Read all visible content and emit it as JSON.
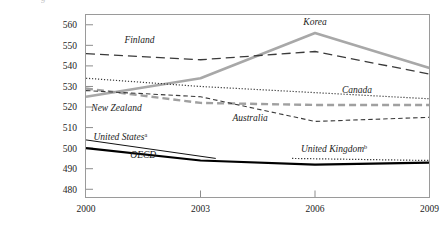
{
  "chart_data": {
    "type": "line",
    "title": "",
    "xlabel": "",
    "ylabel": "",
    "x": [
      2000,
      2003,
      2006,
      2009
    ],
    "xlim": [
      2000,
      2009
    ],
    "ylim": [
      476,
      565
    ],
    "yticks": [
      480,
      490,
      500,
      510,
      520,
      530,
      540,
      550,
      560
    ],
    "xticks": [
      2000,
      2003,
      2006,
      2009
    ],
    "grid": false,
    "legend": "inline-labels",
    "series": [
      {
        "name": "Korea",
        "values": [
          525,
          534,
          556,
          539
        ],
        "style": "thick-gray-solid",
        "color": "#a8a8a8"
      },
      {
        "name": "Finland",
        "values": [
          546,
          543,
          547,
          536
        ],
        "style": "long-dash",
        "color": "#3a3a3a"
      },
      {
        "name": "Canada",
        "values": [
          534,
          530,
          527,
          524
        ],
        "style": "dotted",
        "color": "#3a3a3a"
      },
      {
        "name": "New Zealand",
        "values": [
          529,
          522,
          521,
          521
        ],
        "style": "gray-dash",
        "color": "#a0a0a0"
      },
      {
        "name": "Australia",
        "values": [
          528,
          525,
          513,
          515
        ],
        "style": "fine-dash",
        "color": "#3a3a3a"
      },
      {
        "name": "United States",
        "values": [
          504,
          495,
          0,
          0
        ],
        "style": "thin-black",
        "color": "#111111",
        "note_marker": "a",
        "partial": true
      },
      {
        "name": "OECD",
        "values": [
          500,
          494,
          492,
          493
        ],
        "style": "thick-black",
        "color": "#000000"
      },
      {
        "name": "United Kingdom",
        "values": [
          0,
          0,
          495,
          494
        ],
        "style": "dotted",
        "color": "#2b2b2b",
        "note_marker": "b",
        "partial": true
      }
    ],
    "annotations": [
      {
        "text": "Finland",
        "x": 2001.4,
        "y": 551
      },
      {
        "text": "Korea",
        "x": 2006.0,
        "y": 560
      },
      {
        "text": "Canada",
        "x": 2007.1,
        "y": 527
      },
      {
        "text": "New Zealand",
        "x": 2000.8,
        "y": 518
      },
      {
        "text": "Australia",
        "x": 2004.3,
        "y": 513
      },
      {
        "text": "United States",
        "x": 2000.9,
        "y": 504,
        "marker": "a"
      },
      {
        "text": "OECD",
        "x": 2001.5,
        "y": 495
      },
      {
        "text": "United Kingdom",
        "x": 2006.5,
        "y": 498,
        "marker": "b"
      }
    ]
  }
}
